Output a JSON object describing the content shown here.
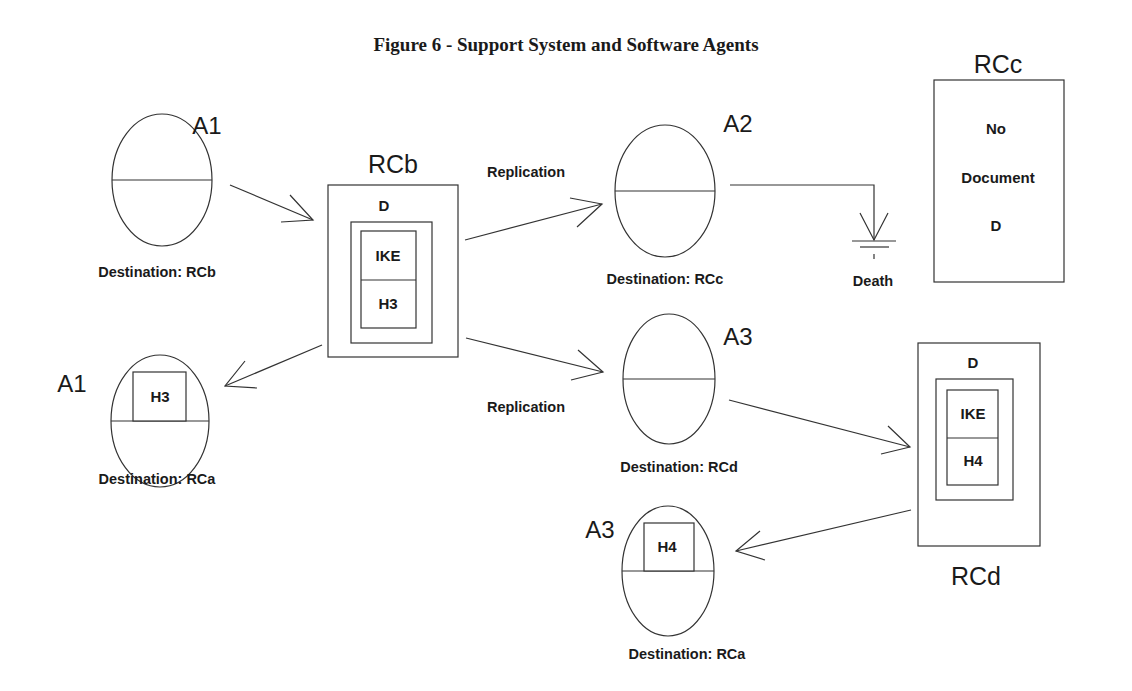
{
  "title": "Figure 6 -  Support System and Software Agents",
  "agents": {
    "a1_top": {
      "label": "A1",
      "destination": "Destination: RCb"
    },
    "a1_bottom": {
      "label": "A1",
      "carried": "H3",
      "destination": "Destination: RCa"
    },
    "a2": {
      "label": "A2",
      "destination": "Destination: RCc"
    },
    "a3_top": {
      "label": "A3",
      "destination": "Destination: RCd"
    },
    "a3_bottom": {
      "label": "A3",
      "carried": "H4",
      "destination": "Destination: RCa"
    }
  },
  "resource_centers": {
    "rcb": {
      "label": "RCb",
      "document": "D",
      "inner_top": "IKE",
      "inner_bottom": "H3"
    },
    "rcc": {
      "label": "RCc",
      "line1": "No",
      "line2": "Document",
      "line3": "D"
    },
    "rcd": {
      "label": "RCd",
      "document": "D",
      "inner_top": "IKE",
      "inner_bottom": "H4"
    }
  },
  "edges": {
    "replication_upper": "Replication",
    "replication_lower": "Replication",
    "death": "Death"
  },
  "colors": {
    "ink": "#333333",
    "background": "#ffffff"
  }
}
